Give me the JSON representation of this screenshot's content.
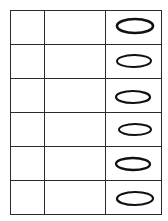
{
  "document": {
    "kind": "answer-grid",
    "background_color": "#ffffff",
    "border_color": "#2b2b2b",
    "mark_color": "#111111"
  },
  "table": {
    "column_count": 3,
    "row_count": 6,
    "columns": [
      {
        "name": "blank-narrow",
        "header": "",
        "width_px": 33
      },
      {
        "name": "blank-wide",
        "header": "",
        "width_px": 60
      },
      {
        "name": "mark",
        "header": "",
        "width_px": 55
      }
    ],
    "rows": [
      {
        "cells": [
          "",
          ""
        ],
        "mark": {
          "shape": "ellipse",
          "filled": false,
          "label": ""
        }
      },
      {
        "cells": [
          "",
          ""
        ],
        "mark": {
          "shape": "ellipse",
          "filled": false,
          "label": ""
        }
      },
      {
        "cells": [
          "",
          ""
        ],
        "mark": {
          "shape": "ellipse",
          "filled": false,
          "label": ""
        }
      },
      {
        "cells": [
          "",
          ""
        ],
        "mark": {
          "shape": "ellipse",
          "filled": false,
          "label": ""
        }
      },
      {
        "cells": [
          "",
          ""
        ],
        "mark": {
          "shape": "ellipse",
          "filled": false,
          "label": ""
        }
      },
      {
        "cells": [
          "",
          ""
        ],
        "mark": {
          "shape": "ellipse",
          "filled": false,
          "label": ""
        }
      }
    ]
  }
}
